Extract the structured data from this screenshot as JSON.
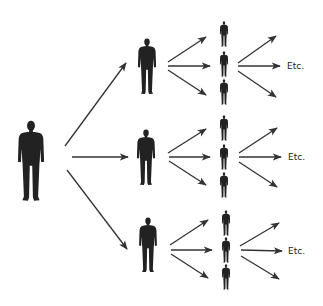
{
  "diagram": {
    "colors": {
      "background": "#ffffff",
      "figure": "#222222",
      "arrow": "#333333",
      "text": "#222222"
    },
    "root": {
      "x": 31,
      "top": 120,
      "height": 82
    },
    "level1": [
      {
        "x": 147,
        "top": 38,
        "height": 57
      },
      {
        "x": 146,
        "top": 129,
        "height": 57
      },
      {
        "x": 148,
        "top": 217,
        "height": 56
      }
    ],
    "level2": [
      [
        {
          "x": 224,
          "top": 21,
          "height": 26
        },
        {
          "x": 224,
          "top": 51,
          "height": 26
        },
        {
          "x": 224,
          "top": 79,
          "height": 26
        }
      ],
      [
        {
          "x": 224,
          "top": 115,
          "height": 26
        },
        {
          "x": 224,
          "top": 144,
          "height": 26
        },
        {
          "x": 224,
          "top": 172,
          "height": 26
        }
      ],
      [
        {
          "x": 226,
          "top": 210,
          "height": 26
        },
        {
          "x": 226,
          "top": 237,
          "height": 26
        },
        {
          "x": 226,
          "top": 264,
          "height": 26
        }
      ]
    ],
    "arrows_level1": [
      {
        "x1": 65,
        "y1": 146,
        "x2": 126,
        "y2": 63
      },
      {
        "x1": 72,
        "y1": 157,
        "x2": 128,
        "y2": 157
      },
      {
        "x1": 67,
        "y1": 170,
        "x2": 127,
        "y2": 249
      }
    ],
    "arrows_level2": [
      [
        {
          "x1": 168,
          "y1": 62,
          "x2": 206,
          "y2": 37
        },
        {
          "x1": 168,
          "y1": 66,
          "x2": 210,
          "y2": 66
        },
        {
          "x1": 168,
          "y1": 70,
          "x2": 206,
          "y2": 95
        }
      ],
      [
        {
          "x1": 168,
          "y1": 153,
          "x2": 206,
          "y2": 129
        },
        {
          "x1": 169,
          "y1": 157,
          "x2": 210,
          "y2": 157
        },
        {
          "x1": 169,
          "y1": 161,
          "x2": 206,
          "y2": 185
        }
      ],
      [
        {
          "x1": 170,
          "y1": 245,
          "x2": 208,
          "y2": 220
        },
        {
          "x1": 171,
          "y1": 250,
          "x2": 212,
          "y2": 250
        },
        {
          "x1": 171,
          "y1": 254,
          "x2": 208,
          "y2": 278
        }
      ]
    ],
    "arrows_level3": [
      [
        {
          "x1": 238,
          "y1": 63,
          "x2": 276,
          "y2": 36
        },
        {
          "x1": 238,
          "y1": 66,
          "x2": 280,
          "y2": 66
        },
        {
          "x1": 238,
          "y1": 71,
          "x2": 276,
          "y2": 97
        }
      ],
      [
        {
          "x1": 239,
          "y1": 153,
          "x2": 277,
          "y2": 128
        },
        {
          "x1": 239,
          "y1": 157,
          "x2": 281,
          "y2": 157
        },
        {
          "x1": 239,
          "y1": 162,
          "x2": 277,
          "y2": 187
        }
      ],
      [
        {
          "x1": 240,
          "y1": 246,
          "x2": 279,
          "y2": 223
        },
        {
          "x1": 241,
          "y1": 250,
          "x2": 282,
          "y2": 251
        },
        {
          "x1": 241,
          "y1": 256,
          "x2": 279,
          "y2": 279
        }
      ]
    ],
    "labels": [
      {
        "text": "Etc.",
        "x": 287,
        "y": 69
      },
      {
        "text": "Etc.",
        "x": 288,
        "y": 160
      },
      {
        "text": "Etc.",
        "x": 288,
        "y": 254
      }
    ]
  }
}
